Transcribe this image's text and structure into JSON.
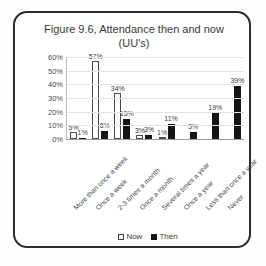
{
  "chart_data": {
    "type": "bar",
    "title": "Figure 9.6, Attendance then and now (UU's)",
    "xlabel": "",
    "ylabel": "",
    "ylim": [
      0,
      60
    ],
    "ytick_labels": [
      "60%",
      "50%",
      "40%",
      "30%",
      "20%",
      "10%",
      "0%"
    ],
    "ytick_values": [
      60,
      50,
      40,
      30,
      20,
      10,
      0
    ],
    "grid": true,
    "legend_position": "bottom",
    "categories": [
      "More than once a week",
      "Once a week",
      "2-3 times a month",
      "Once a month",
      "Several times a year",
      "Once a year",
      "Less than once a year",
      "Never"
    ],
    "series": [
      {
        "name": "Now",
        "color": "#ffffff",
        "values": [
          5,
          57,
          34,
          3,
          1,
          null,
          null,
          null
        ],
        "labels": [
          "5%",
          "57%",
          "34%",
          "3%",
          "1%",
          "",
          "",
          ""
        ]
      },
      {
        "name": "Then",
        "color": "#151515",
        "values": [
          1,
          6,
          15,
          3,
          11,
          5,
          19,
          39
        ],
        "labels": [
          "1%",
          "6%",
          "15%",
          "3%",
          "11%",
          "5%",
          "19%",
          "39%"
        ]
      }
    ]
  },
  "legend": {
    "items": [
      {
        "label": "Now",
        "marker": "hollow-square"
      },
      {
        "label": "Then",
        "marker": "filled-square"
      }
    ]
  },
  "page_bleed": {
    "text": "· · · · · · · · · · · · · · · · · · · · · · · · · · ·"
  }
}
